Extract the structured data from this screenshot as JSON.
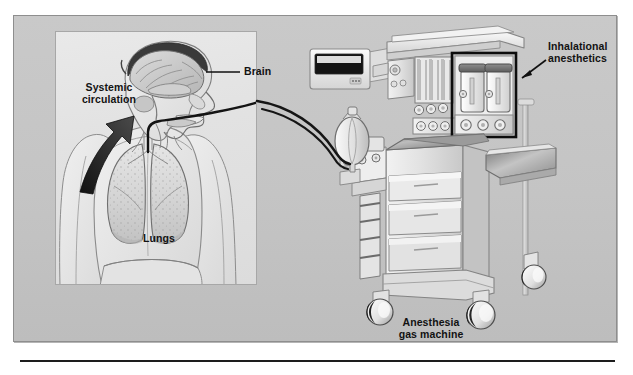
{
  "figure": {
    "kind": "medical-illustration",
    "background_color": "#c4c4c4",
    "panel_border_color": "#8e8e8e",
    "inset_background_color": "#e4e4e4",
    "ink_color": "#1d1d1d"
  },
  "labels": {
    "brain": "Brain",
    "systemic_circulation": "Systemic\ncirculation",
    "lungs": "Lungs",
    "inhalational_anesthetics": "Inhalational\nanesthetics",
    "anesthesia_gas_machine": "Anesthesia\ngas machine"
  },
  "annotations": {
    "brain_leader": "horizontal leader line from Brain label to brain in sagittal head section",
    "systemic_circulation_arrow": "thick black arrow pointing up-right toward the neck/head",
    "inhalational_anesthetics_arrow": "thin black arrow pointing down-left toward the vaporizer bottles",
    "vaporizer_highlight_box": "black rectangle outlining the two vaporizer bottles"
  },
  "patient_panel": {
    "parts": [
      "sagittal head section",
      "brain",
      "nasal cavity",
      "tongue",
      "trachea",
      "endotracheal tube",
      "left lung",
      "right lung",
      "torso",
      "arms"
    ]
  },
  "machine": {
    "parts": [
      "display monitor",
      "top shelf",
      "flowmeter bank",
      "vaporizer bottle left",
      "vaporizer bottle right",
      "control knobs",
      "work surface",
      "side tray",
      "drawer upper",
      "drawer middle",
      "drawer lower",
      "reservoir breathing bag",
      "breathing circuit tubing",
      "absorber canister",
      "caster front-left",
      "caster front-right",
      "caster rear"
    ]
  }
}
